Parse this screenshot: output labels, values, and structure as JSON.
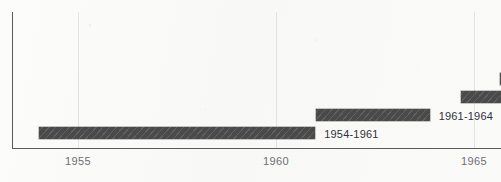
{
  "chart_data": {
    "type": "bar",
    "orientation": "horizontal",
    "title": "",
    "subtitle": "",
    "xlabel": "",
    "ylabel": "",
    "xlim": [
      1953.33,
      1965.68
    ],
    "grid": true,
    "grid_axis": "x",
    "legend": "none",
    "annotations": "Bar end labels show the year span of each bar; the two uppermost bars are clipped by the right edge of the image and carry no label.",
    "xticks": [
      {
        "label": "1955",
        "value": 1955
      },
      {
        "label": "1960",
        "value": 1960
      },
      {
        "label": "1965",
        "value": 1965
      }
    ],
    "bars": [
      {
        "label": "",
        "start": 1965.65,
        "end": 1966.35,
        "clipped_right": true
      },
      {
        "label": "",
        "start": 1964.66,
        "end": 1966.35,
        "clipped_right": true
      },
      {
        "label": "1961-1964",
        "start": 1961.0,
        "end": 1963.88,
        "clipped_right": false
      },
      {
        "label": "1954-1961",
        "start": 1954.02,
        "end": 1960.99,
        "clipped_right": false
      }
    ],
    "series": [
      {
        "name": "1954-1961",
        "start": 1954,
        "end": 1961,
        "duration_years": 7
      },
      {
        "name": "1961-1964",
        "start": 1961,
        "end": 1964,
        "duration_years": 3
      }
    ]
  },
  "style": {
    "bar_color": "#4a4a4a",
    "bar_hatch": "diagonal",
    "axis_color": "#5a5a5a",
    "grid_color": "#e3e3e3",
    "tick_label_color": "#6e6e74",
    "bar_label_color": "#32323a",
    "background_color": "#fbfbfa"
  },
  "geometry": {
    "axis_y_x": 12,
    "axis_y_top": 12,
    "baseline_y": 148,
    "plot_right": 501,
    "px_per_year": 39.6,
    "year_1955_x": 78,
    "year_1960_x": 276,
    "year_1965_x": 474,
    "bar_height": 12,
    "bar_tops": [
      73,
      91,
      109,
      127
    ]
  }
}
